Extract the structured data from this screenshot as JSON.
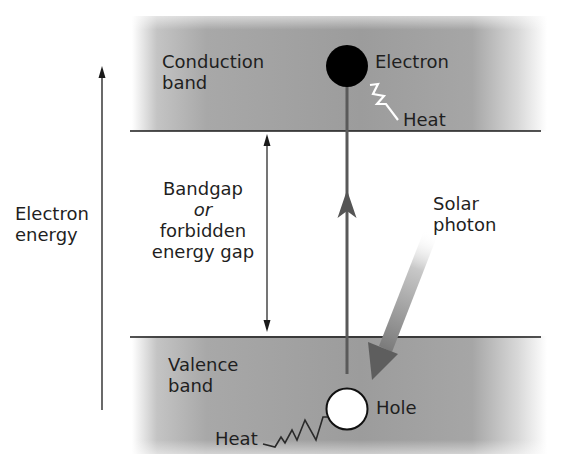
{
  "diagram": {
    "type": "semiconductor band diagram",
    "axis": {
      "label_line1": "Electron",
      "label_line2": "energy",
      "direction": "up"
    },
    "conduction_band": {
      "label_line1": "Conduction",
      "label_line2": "band"
    },
    "valence_band": {
      "label_line1": "Valence",
      "label_line2": "band"
    },
    "bandgap": {
      "line1": "Bandgap",
      "line2": "or",
      "line3": "forbidden",
      "line4": "energy gap"
    },
    "electron": {
      "label": "Electron"
    },
    "hole": {
      "label": "Hole"
    },
    "heat_top": {
      "label": "Heat"
    },
    "heat_bottom": {
      "label": "Heat"
    },
    "photon": {
      "label_line1": "Solar",
      "label_line2": "photon"
    },
    "colors": {
      "band_fill": "#9a9a9a",
      "band_fade": "#ffffff",
      "line": "#1a1a1a",
      "transition_arrow": "#5a5a5a",
      "electron": "#000000",
      "hole": "#ffffff"
    }
  }
}
